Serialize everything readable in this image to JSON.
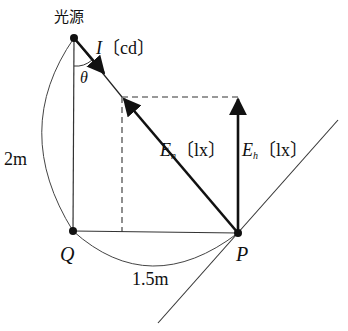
{
  "labels": {
    "source": "光源",
    "intensity_symbol": "I",
    "intensity_unit": "〔cd〕",
    "theta": "θ",
    "height": "2m",
    "normal_symbol": "E",
    "normal_sub": "n",
    "normal_unit": "〔lx〕",
    "horizontal_symbol": "E",
    "horizontal_sub": "h",
    "horizontal_unit": "〔lx〕",
    "point_q": "Q",
    "point_p": "P",
    "distance": "1.5m"
  },
  "geometry": {
    "source": [
      74,
      38
    ],
    "q": [
      73,
      231
    ],
    "p": [
      238,
      233
    ],
    "normal_tip": [
      122,
      97
    ],
    "horizontal_tip": [
      238,
      97
    ]
  }
}
